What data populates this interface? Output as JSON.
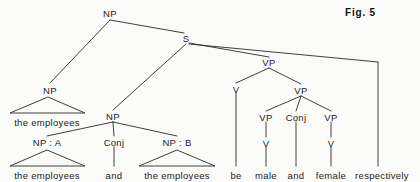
{
  "figure": {
    "caption": "Fig. 5",
    "caption_x": 345,
    "caption_y": 7,
    "width": 420,
    "height": 182,
    "background": "#fbfbf9",
    "ink_color": "#2a2a2a"
  },
  "tree": {
    "type": "constituency-syntax-tree",
    "nodes": [
      {
        "id": "np-root",
        "label": "NP",
        "x": 110,
        "y": 13,
        "kind": "nonterminal"
      },
      {
        "id": "np-left",
        "label": "NP",
        "x": 50,
        "y": 90,
        "kind": "nonterminal"
      },
      {
        "id": "s-node",
        "label": "S",
        "x": 186,
        "y": 38,
        "kind": "nonterminal"
      },
      {
        "id": "np-mid",
        "label": "NP",
        "x": 113,
        "y": 116,
        "kind": "nonterminal"
      },
      {
        "id": "np-a",
        "label": "NP : A",
        "x": 47,
        "y": 142,
        "kind": "nonterminal"
      },
      {
        "id": "conj-left",
        "label": "Conj",
        "x": 114,
        "y": 142,
        "kind": "nonterminal"
      },
      {
        "id": "np-b",
        "label": "NP : B",
        "x": 177,
        "y": 142,
        "kind": "nonterminal"
      },
      {
        "id": "vp-top",
        "label": "VP",
        "x": 269,
        "y": 62,
        "kind": "nonterminal"
      },
      {
        "id": "v-be",
        "label": "V",
        "x": 236,
        "y": 89,
        "kind": "nonterminal"
      },
      {
        "id": "vp-coord",
        "label": "VP",
        "x": 301,
        "y": 90,
        "kind": "nonterminal"
      },
      {
        "id": "vp-male",
        "label": "VP",
        "x": 266,
        "y": 117,
        "kind": "nonterminal"
      },
      {
        "id": "conj-right",
        "label": "Conj",
        "x": 296,
        "y": 117,
        "kind": "nonterminal"
      },
      {
        "id": "vp-female",
        "label": "VP",
        "x": 331,
        "y": 117,
        "kind": "nonterminal"
      },
      {
        "id": "v-male",
        "label": "V",
        "x": 266,
        "y": 143,
        "kind": "nonterminal"
      },
      {
        "id": "v-female",
        "label": "V",
        "x": 331,
        "y": 143,
        "kind": "nonterminal"
      }
    ],
    "leaves": [
      {
        "id": "leaf-emp-top",
        "label": "the employees",
        "x": 47,
        "y": 122
      },
      {
        "id": "leaf-emp-a",
        "label": "the employees",
        "x": 47,
        "y": 175
      },
      {
        "id": "leaf-and-left",
        "label": "and",
        "x": 114,
        "y": 175
      },
      {
        "id": "leaf-emp-b",
        "label": "the employees",
        "x": 177,
        "y": 175
      },
      {
        "id": "leaf-be",
        "label": "be",
        "x": 236,
        "y": 175
      },
      {
        "id": "leaf-male",
        "label": "male",
        "x": 266,
        "y": 175
      },
      {
        "id": "leaf-and-right",
        "label": "and",
        "x": 296,
        "y": 175
      },
      {
        "id": "leaf-female",
        "label": "female",
        "x": 331,
        "y": 175
      },
      {
        "id": "leaf-respect",
        "label": "respectively",
        "x": 382,
        "y": 175
      }
    ],
    "edges": [
      {
        "id": "e-root-npleft",
        "from": "np-root",
        "to": "np-left",
        "path": "M 110 20 L 50 83"
      },
      {
        "id": "e-root-s",
        "from": "np-root",
        "to": "s-node",
        "path": "M 110 20 L 184 33"
      },
      {
        "id": "e-s-npmid",
        "from": "s-node",
        "to": "np-mid",
        "path": "M 186 44 L 113 110"
      },
      {
        "id": "e-s-vp",
        "from": "s-node",
        "to": "vp-top",
        "path": "M 189 43 L 269 57"
      },
      {
        "id": "e-s-adv-h",
        "from": "s-node",
        "to": "adv-bar",
        "path": "M 189 44 L 378 62"
      },
      {
        "id": "e-adv-drop",
        "from": "adv-bar",
        "to": "leaf-respect",
        "path": "M 378 62 L 378 166"
      },
      {
        "id": "e-npmid-a",
        "from": "np-mid",
        "to": "np-a",
        "path": "M 113 122 L 47 136"
      },
      {
        "id": "e-npmid-conj",
        "from": "np-mid",
        "to": "conj-left",
        "path": "M 113 122 L 114 136"
      },
      {
        "id": "e-npmid-b",
        "from": "np-mid",
        "to": "np-b",
        "path": "M 113 122 L 177 136"
      },
      {
        "id": "e-conjl-and",
        "from": "conj-left",
        "to": "leaf-and-left",
        "path": "M 114 147 L 114 166"
      },
      {
        "id": "e-vptop-v",
        "from": "vp-top",
        "to": "v-be",
        "path": "M 269 68 L 236 83"
      },
      {
        "id": "e-vptop-vp",
        "from": "vp-top",
        "to": "vp-coord",
        "path": "M 269 68 L 301 84"
      },
      {
        "id": "e-vbe-leaf",
        "from": "v-be",
        "to": "leaf-be",
        "path": "M 236 93 L 236 166"
      },
      {
        "id": "e-vpc-male",
        "from": "vp-coord",
        "to": "vp-male",
        "path": "M 301 96 L 266 111"
      },
      {
        "id": "e-vpc-conj",
        "from": "vp-coord",
        "to": "conj-right",
        "path": "M 301 96 L 296 111"
      },
      {
        "id": "e-vpc-female",
        "from": "vp-coord",
        "to": "vp-female",
        "path": "M 301 96 L 331 111"
      },
      {
        "id": "e-vpmale-v",
        "from": "vp-male",
        "to": "v-male",
        "path": "M 266 122 L 266 137"
      },
      {
        "id": "e-conjr-and",
        "from": "conj-right",
        "to": "leaf-and-right",
        "path": "M 296 122 L 296 166"
      },
      {
        "id": "e-vpfem-v",
        "from": "vp-female",
        "to": "v-female",
        "path": "M 331 122 L 331 137"
      },
      {
        "id": "e-vmale-leaf",
        "from": "v-male",
        "to": "leaf-male",
        "path": "M 266 147 L 266 166"
      },
      {
        "id": "e-vfem-leaf",
        "from": "v-female",
        "to": "leaf-female",
        "path": "M 331 147 L 331 166"
      }
    ],
    "triangles": [
      {
        "id": "tri-emp-top",
        "for": "np-left",
        "apex_x": 48,
        "apex_y": 97,
        "left_x": 10,
        "right_x": 85,
        "base_y": 113
      },
      {
        "id": "tri-emp-a",
        "for": "np-a",
        "apex_x": 47,
        "apex_y": 150,
        "left_x": 10,
        "right_x": 85,
        "base_y": 166
      },
      {
        "id": "tri-emp-b",
        "for": "np-b",
        "apex_x": 177,
        "apex_y": 150,
        "left_x": 139,
        "right_x": 215,
        "base_y": 166
      }
    ]
  }
}
